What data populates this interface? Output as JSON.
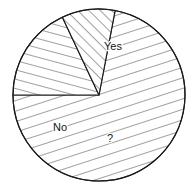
{
  "chart_data": {
    "type": "pie",
    "title": "",
    "subtitle": "",
    "xlabel": "",
    "ylabel": "",
    "grid": false,
    "legend_position": "none",
    "labels_inside_slices": true,
    "categories": [
      "Yes",
      "No",
      "?"
    ],
    "values": [
      72,
      18,
      10
    ],
    "units": "percent",
    "slices": [
      {
        "label": "Yes",
        "value": 72,
        "start_angle_deg": 180,
        "end_angle_deg": 439.2,
        "sweep_deg": 259.2,
        "fill": "#ffffff",
        "stroke": "#1a1a1a",
        "hatch_pattern": "diagonal-steep-ne-sw",
        "hatch_angle_deg": 72,
        "label_x": 113,
        "label_y": 47
      },
      {
        "label": "No",
        "value": 18,
        "start_angle_deg": 115.2,
        "end_angle_deg": 180,
        "sweep_deg": 64.8,
        "fill": "#ffffff",
        "stroke": "#1a1a1a",
        "hatch_pattern": "near-horizontal",
        "hatch_angle_deg": 15,
        "label_x": 60,
        "label_y": 128
      },
      {
        "label": "?",
        "value": 10,
        "start_angle_deg": 79.2,
        "end_angle_deg": 115.2,
        "sweep_deg": 36,
        "fill": "#ffffff",
        "stroke": "#1a1a1a",
        "hatch_pattern": "diagonal-45-nw-se",
        "hatch_angle_deg": 135,
        "label_x": 110,
        "label_y": 139
      }
    ],
    "geometry": {
      "center_x": 99,
      "center_y": 95,
      "radius": 86
    },
    "colors": {
      "background": "#ffffff",
      "outline": "#1a1a1a",
      "hatch": "#1f1f1f",
      "label_text": "#141414"
    }
  }
}
